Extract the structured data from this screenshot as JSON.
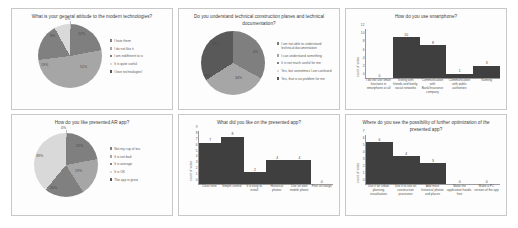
{
  "colors": {
    "slice_1": "#7f7f7f",
    "slice_2": "#a6a6a6",
    "slice_3": "#808080",
    "slice_4": "#d9d9d9",
    "slice_5": "#595959",
    "bar": "#3f3f3f",
    "axis": "#9a9a9a",
    "panel_border": "#c8c8c8"
  },
  "panels": [
    {
      "id": "attitude-to-modern-technologies",
      "title": "What is your general  attitude to the modern technologies?",
      "chart_data": {
        "type": "pie",
        "title": "What is your general  attitude to the modern technologies?",
        "labels": [
          "I hate them",
          "I do not like it",
          "I am indifferent to is",
          "It is quite useful",
          "I love technologies!"
        ],
        "values": [
          22,
          51,
          19,
          8,
          0
        ],
        "data_labels": [
          "22%",
          "51%",
          "19%",
          "8%",
          "0%"
        ],
        "legend_position": "right"
      }
    },
    {
      "id": "understand-technical-documentation",
      "title": "Do you understand technical construction planes and technical documentation?",
      "chart_data": {
        "type": "pie",
        "title": "Do you understand technical construction planes and technical documentation?",
        "labels": [
          "I am not able to understand technical documentation",
          "I can understand something",
          "It is not much useful for me",
          "Yes, but sometimes I am confused",
          "Yes, that is no problem for me"
        ],
        "values": [
          33,
          33,
          0,
          0,
          34
        ],
        "data_labels": [
          "33%",
          "33%",
          "0%",
          "",
          "34%"
        ],
        "legend_position": "right"
      }
    },
    {
      "id": "how-do-you-use-smartphone",
      "title": "How do you use smartphone?",
      "chart_data": {
        "type": "bar",
        "title": "How do you use smartphone?",
        "ylabel": "count of votes",
        "xlabel": "",
        "ylim": [
          0,
          12
        ],
        "yticks": [
          0,
          2,
          4,
          6,
          8,
          10,
          12
        ],
        "categories": [
          "I do not use smart functions in smartphone at all",
          "Texting with friends and family, social networks",
          "Communication with Bank/Insurance company",
          "Communication with public authorities",
          "Gaming"
        ],
        "values": [
          0,
          10,
          8,
          1,
          3
        ],
        "data_labels": [
          "0",
          "10",
          "8",
          "1",
          "3"
        ],
        "grid": false
      }
    },
    {
      "id": "how-do-you-like-presented-ar-app",
      "title": "How do you like presented AR app?",
      "chart_data": {
        "type": "pie",
        "title": "How do you like presented AR app?",
        "labels": [
          "Not my cup of tea",
          "It is not bad",
          "It is average",
          "It is OK",
          "The app is great"
        ],
        "values": [
          22,
          19,
          20,
          39,
          0
        ],
        "data_labels": [
          "22%",
          "19%",
          "20%",
          "39%",
          "0%"
        ],
        "legend_position": "right"
      }
    },
    {
      "id": "what-did-you-like",
      "title": "What did you like on the presented app?",
      "chart_data": {
        "type": "bar",
        "title": "What did you like on the presented app?",
        "ylabel": "count of votes",
        "xlabel": "",
        "ylim": [
          0,
          9
        ],
        "yticks": [
          0,
          1,
          2,
          3,
          4,
          5,
          6,
          7,
          8,
          9
        ],
        "categories": [
          "Clear view",
          "Simple control",
          "It is easy to install",
          "Historical photos",
          "Use on own mobile phone",
          "Free of charge"
        ],
        "values": [
          7,
          8,
          2,
          4,
          4,
          0
        ],
        "data_labels": [
          "7",
          "8",
          "2",
          "4",
          "4",
          "0"
        ],
        "grid": false
      }
    },
    {
      "id": "possibility-of-further-optimization",
      "title": "Where do you see the possibility of further optimization of the presented app?",
      "chart_data": {
        "type": "bar",
        "title": "Where do you see the possibility of further optimization of the presented app?",
        "ylabel": "count of votes",
        "xlabel": "",
        "ylim": [
          0,
          7
        ],
        "yticks": [
          0,
          1,
          2,
          3,
          4,
          5,
          6,
          7
        ],
        "categories": [
          "Use it for urban planning visualization",
          "Use it to use on construction processes",
          "Add more historical photos and places",
          "Make the application hands-free",
          "Make a PC version of the app"
        ],
        "values": [
          6,
          4,
          3,
          0,
          0
        ],
        "data_labels": [
          "6",
          "4",
          "3",
          "0",
          "0"
        ],
        "grid": false
      }
    }
  ]
}
